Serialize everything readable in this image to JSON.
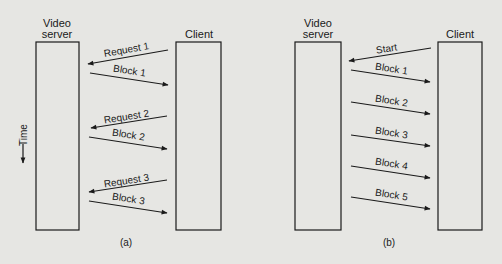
{
  "figure": {
    "panels": [
      {
        "id": "a",
        "caption": "(a)",
        "server_label_lines": [
          "Video",
          "server"
        ],
        "client_label": "Client",
        "time_label": "Time",
        "messages": [
          {
            "label": "Request 1",
            "direction": "client-to-server"
          },
          {
            "label": "Block 1",
            "direction": "server-to-client"
          },
          {
            "label": "Request 2",
            "direction": "client-to-server"
          },
          {
            "label": "Block 2",
            "direction": "server-to-client"
          },
          {
            "label": "Request 3",
            "direction": "client-to-server"
          },
          {
            "label": "Block 3",
            "direction": "server-to-client"
          }
        ]
      },
      {
        "id": "b",
        "caption": "(b)",
        "server_label_lines": [
          "Video",
          "server"
        ],
        "client_label": "Client",
        "messages": [
          {
            "label": "Start",
            "direction": "client-to-server"
          },
          {
            "label": "Block 1",
            "direction": "server-to-client"
          },
          {
            "label": "Block 2",
            "direction": "server-to-client"
          },
          {
            "label": "Block 3",
            "direction": "server-to-client"
          },
          {
            "label": "Block 4",
            "direction": "server-to-client"
          },
          {
            "label": "Block 5",
            "direction": "server-to-client"
          }
        ]
      }
    ],
    "colors": {
      "background": "#e6e6e3",
      "ink": "#1a1a1a"
    }
  }
}
